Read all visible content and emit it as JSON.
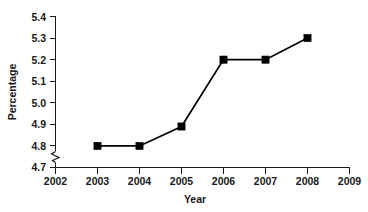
{
  "chart_data": {
    "type": "line",
    "title": "",
    "subtitle": "",
    "xlabel": "Year",
    "ylabel": "Percentage",
    "x": [
      2003,
      2004,
      2005,
      2006,
      2007,
      2008
    ],
    "values": [
      4.8,
      4.8,
      4.89,
      5.2,
      5.2,
      5.3
    ],
    "series": [
      {
        "name": "Percentage",
        "x": [
          2003,
          2004,
          2005,
          2006,
          2007,
          2008
        ],
        "values": [
          4.8,
          4.8,
          4.89,
          5.2,
          5.2,
          5.3
        ],
        "color": "#000000",
        "marker": "filled-square",
        "line_style": "solid"
      }
    ],
    "xlim": [
      2002,
      2009
    ],
    "ylim": [
      4.7,
      5.4
    ],
    "x_ticks": [
      "2002",
      "2003",
      "2004",
      "2005",
      "2006",
      "2007",
      "2008",
      "2009"
    ],
    "y_ticks": [
      "4.7",
      "4.8",
      "4.9",
      "5.0",
      "5.1",
      "5.2",
      "5.3",
      "5.4"
    ],
    "y_axis_break": true,
    "y_axis_break_between": [
      "4.7",
      "4.8"
    ],
    "grid": false,
    "legend": false,
    "legend_position": "none",
    "annotations": []
  },
  "colors": {
    "line": "#000000",
    "marker": "#000000",
    "axis": "#1a1a1a",
    "text": "#1a1a1a",
    "background": "#ffffff"
  },
  "axes": {
    "y": {
      "title": "Percentage",
      "ticks": [
        {
          "label": "5.4",
          "value": 5.4
        },
        {
          "label": "5.3",
          "value": 5.3
        },
        {
          "label": "5.2",
          "value": 5.2
        },
        {
          "label": "5.1",
          "value": 5.1
        },
        {
          "label": "5.0",
          "value": 5.0
        },
        {
          "label": "4.9",
          "value": 4.9
        },
        {
          "label": "4.8",
          "value": 4.8
        },
        {
          "label": "4.7",
          "value": 4.7
        }
      ]
    },
    "x": {
      "title": "Year",
      "ticks": [
        {
          "label": "2002",
          "value": 2002
        },
        {
          "label": "2003",
          "value": 2003
        },
        {
          "label": "2004",
          "value": 2004
        },
        {
          "label": "2005",
          "value": 2005
        },
        {
          "label": "2006",
          "value": 2006
        },
        {
          "label": "2007",
          "value": 2007
        },
        {
          "label": "2008",
          "value": 2008
        },
        {
          "label": "2009",
          "value": 2009
        }
      ]
    }
  }
}
